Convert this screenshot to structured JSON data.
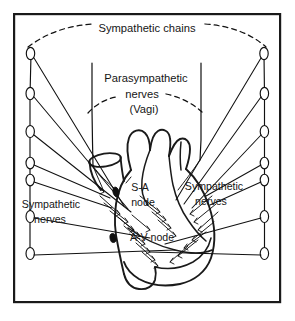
{
  "figure": {
    "background_color": "#ffffff",
    "ink_color": "#111111",
    "frame": {
      "border_color": "#1a1a1a",
      "x": 13,
      "y": 13,
      "width": 268,
      "height": 290
    }
  },
  "labels": {
    "sympathetic_chains": "Sympathetic chains",
    "parasympathetic_line1": "Parasympathetic",
    "parasympathetic_line2": "nerves",
    "parasympathetic_line3": "(Vagi)",
    "sa_node_line1": "S-A",
    "sa_node_line2": "node",
    "av_node": "A-V node",
    "sympathetic_nerves_left_line1": "Sympathetic",
    "sympathetic_nerves_left_line2": "nerves",
    "sympathetic_nerves_right_line1": "Sympathetic",
    "sympathetic_nerves_right_line2": "nerves"
  },
  "structures": {
    "left_chain_ganglia_count": 7,
    "right_chain_ganglia_count": 7,
    "vagus_trunks_count": 2,
    "nodes": [
      "S-A node",
      "A-V node"
    ]
  }
}
